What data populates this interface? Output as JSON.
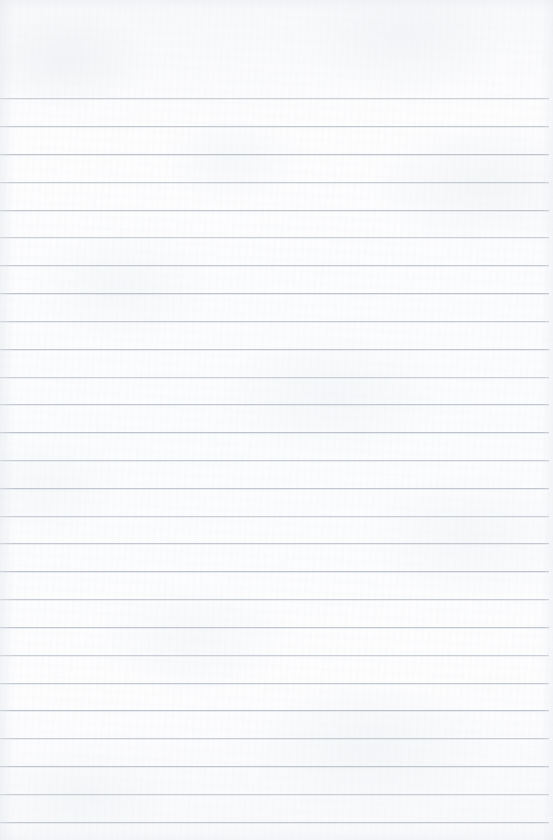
{
  "page": {
    "kind": "lined-notebook-paper",
    "width": 553,
    "height": 840,
    "paper_color": "#fcfcfd",
    "rule_color": "#b8bec8",
    "has_text_content": false,
    "has_margin_rule": false,
    "body_text": ""
  },
  "ruling": {
    "line_count": 27,
    "first_line_y": 98,
    "last_line_y": 822,
    "line_spacing": 27.85,
    "line_thickness": 1,
    "line_left_x": 0,
    "line_right_x": 549,
    "top_margin_height": 98,
    "bottom_margin_height": 18,
    "right_margin_width": 4,
    "lines_y": [
      98,
      126,
      154,
      182,
      210,
      237,
      265,
      293,
      321,
      349,
      377,
      404,
      432,
      460,
      488,
      516,
      543,
      571,
      599,
      627,
      655,
      683,
      710,
      738,
      766,
      794,
      822
    ]
  }
}
